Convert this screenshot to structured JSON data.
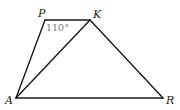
{
  "diagram": {
    "type": "geometry-quadrilateral",
    "points": {
      "P": {
        "label": "P",
        "x": 45,
        "y": 20
      },
      "K": {
        "label": "K",
        "x": 90,
        "y": 20
      },
      "A": {
        "label": "A",
        "x": 16,
        "y": 98
      },
      "R": {
        "label": "R",
        "x": 163,
        "y": 98
      }
    },
    "segments": [
      "PK",
      "PA",
      "AK",
      "KR",
      "AR"
    ],
    "angle_label": {
      "vertex": "P",
      "text": "110°"
    },
    "colors": {
      "line": "#1a1a1a",
      "angle_text": "#777777",
      "label": "#222222"
    }
  }
}
